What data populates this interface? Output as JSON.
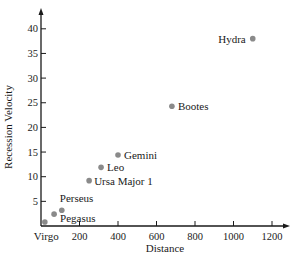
{
  "chart_data": {
    "type": "scatter",
    "title": "",
    "xlabel": "Distance",
    "ylabel": "Recession Velocity",
    "xlim": [
      0,
      1250
    ],
    "ylim": [
      0,
      43
    ],
    "grid": false,
    "legend": null,
    "x_ticks": [
      "200",
      "400",
      "600",
      "800",
      "1000",
      "1200"
    ],
    "y_ticks": [
      "5",
      "10",
      "15",
      "20",
      "25",
      "30",
      "35",
      "40"
    ],
    "point_color": "#8a8a8a",
    "points": [
      {
        "label": "Virgo",
        "x": 20,
        "y": 0.8
      },
      {
        "label": "Pegasus",
        "x": 68,
        "y": 2.4
      },
      {
        "label": "Perseus",
        "x": 108,
        "y": 3.2
      },
      {
        "label": "Ursa Major 1",
        "x": 250,
        "y": 9.2
      },
      {
        "label": "Leo",
        "x": 312,
        "y": 11.9
      },
      {
        "label": "Gemini",
        "x": 400,
        "y": 14.4
      },
      {
        "label": "Bootes",
        "x": 680,
        "y": 24.3
      },
      {
        "label": "Hydra",
        "x": 1100,
        "y": 38.0
      }
    ]
  }
}
